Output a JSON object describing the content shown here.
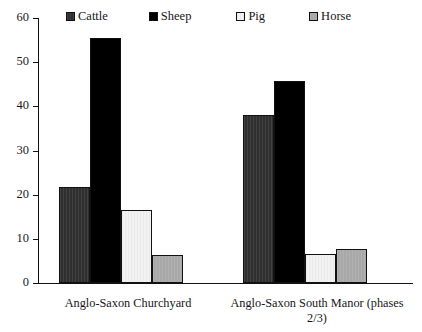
{
  "chart_data": {
    "type": "bar",
    "title": "",
    "xlabel": "",
    "ylabel": "",
    "ylim": [
      0,
      60
    ],
    "yticks": [
      0,
      10,
      20,
      30,
      40,
      50,
      60
    ],
    "ytick_labels": [
      "0",
      "10",
      "20",
      "30",
      "40",
      "50",
      "60"
    ],
    "grid": false,
    "legend_position": "top",
    "categories": [
      "Anglo-Saxon Churchyard",
      "Anglo-Saxon South Manor (phases 2/3)"
    ],
    "series": [
      {
        "name": "Cattle",
        "values": [
          21.8,
          38.0
        ],
        "color": "#2f2f2f",
        "pattern": "vertical-stripe-dark"
      },
      {
        "name": "Sheep",
        "values": [
          55.5,
          45.7
        ],
        "color": "#000000",
        "pattern": "solid-black"
      },
      {
        "name": "Pig",
        "values": [
          16.5,
          6.6
        ],
        "color": "#f2f2f2",
        "pattern": "vertical-stripe-light"
      },
      {
        "name": "Horse",
        "values": [
          6.3,
          7.7
        ],
        "color": "#a8a8a8",
        "pattern": "vertical-stripe-gray"
      }
    ]
  },
  "legend": {
    "items": [
      {
        "label": "Cattle"
      },
      {
        "label": "Sheep"
      },
      {
        "label": "Pig"
      },
      {
        "label": "Horse"
      }
    ]
  },
  "axis": {
    "y_labels": [
      "60",
      "50",
      "40",
      "30",
      "20",
      "10",
      "0"
    ]
  }
}
